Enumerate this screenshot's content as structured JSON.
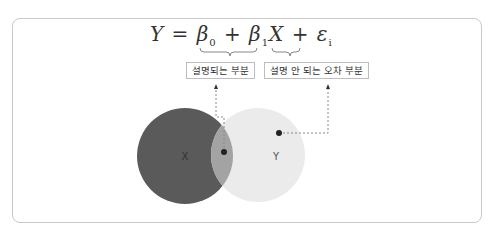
{
  "formula": {
    "Y": "Y",
    "eq": " = ",
    "beta": "β",
    "sub0": "0",
    "plus1": " + ",
    "sub1": "1",
    "X": "X",
    "plus2": " + ",
    "eps": "ε",
    "subi": "i"
  },
  "labels": {
    "explained": "설명되는 부분",
    "unexplained": "설명 안 되는 오차 부분"
  },
  "venn": {
    "x_label": "X",
    "y_label": "Y",
    "x_color": "#555555",
    "y_color": "#e8e8e8",
    "overlap_color": "#9a9a9a"
  }
}
